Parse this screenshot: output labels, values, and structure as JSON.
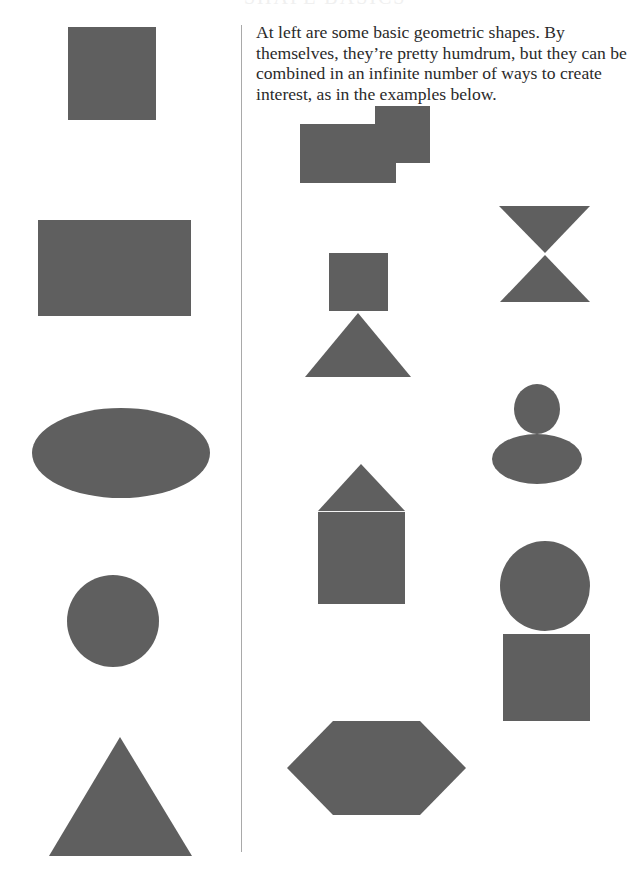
{
  "page": {
    "heading_fragment": "SHAPE BASICS",
    "intro_text": "At left are some basic geometric shapes. By themselves, they’re pretty humdrum, but they can be combined in an infinite number of ways to create interest, as in the examples below."
  },
  "colors": {
    "shape_fill": "#5f5f5f",
    "divider": "#a9a9a9",
    "text": "#2a2a2a",
    "background": "#ffffff"
  },
  "basic_shapes": [
    {
      "name": "square"
    },
    {
      "name": "rectangle"
    },
    {
      "name": "oval"
    },
    {
      "name": "circle"
    },
    {
      "name": "triangle"
    }
  ],
  "combined_examples": [
    {
      "name": "overlapping-rectangles",
      "parts": [
        "rectangle",
        "rectangle"
      ]
    },
    {
      "name": "hourglass",
      "parts": [
        "inverted-triangle",
        "triangle"
      ]
    },
    {
      "name": "square-on-triangle",
      "parts": [
        "square",
        "triangle"
      ]
    },
    {
      "name": "circle-on-oval",
      "parts": [
        "circle",
        "oval"
      ]
    },
    {
      "name": "house",
      "parts": [
        "triangle",
        "square"
      ]
    },
    {
      "name": "circle-on-square",
      "parts": [
        "circle",
        "square"
      ]
    },
    {
      "name": "hexagon",
      "parts": [
        "triangle",
        "rectangle",
        "triangle"
      ]
    }
  ]
}
